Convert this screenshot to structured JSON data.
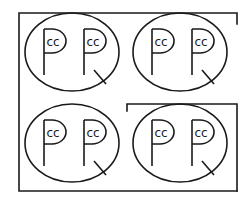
{
  "figure": {
    "stroke_color": "#1a1a1a",
    "background": "#ffffff",
    "cells": [
      {
        "id": "top-left",
        "left_glyph_text": "cc",
        "right_glyph_text": "cc"
      },
      {
        "id": "top-right",
        "left_glyph_text": "cc",
        "right_glyph_text": "cc"
      },
      {
        "id": "bottom-left",
        "left_glyph_text": "cc",
        "right_glyph_text": "cc"
      },
      {
        "id": "bottom-right",
        "left_glyph_text": "cc",
        "right_glyph_text": "cc"
      }
    ]
  }
}
